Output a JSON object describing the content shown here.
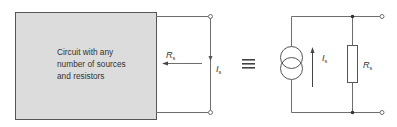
{
  "diagram": {
    "type": "circuit-equivalence",
    "left_circuit": {
      "box_text": [
        "Circuit with  any",
        "number of sources",
        "and resistors"
      ],
      "resistance_label": {
        "symbol": "R",
        "subscript": "s"
      },
      "current_label": {
        "symbol": "I",
        "subscript": "s"
      }
    },
    "equivalence_symbol": "≡",
    "right_circuit": {
      "source_type": "current-source",
      "current_label": {
        "symbol": "I",
        "subscript": "s"
      },
      "resistor_label": {
        "symbol": "R",
        "subscript": "s"
      }
    },
    "colors": {
      "box_fill": "#dcdcdc",
      "box_border": "#555555",
      "wire": "#6e6e6e",
      "text": "#333333"
    }
  }
}
